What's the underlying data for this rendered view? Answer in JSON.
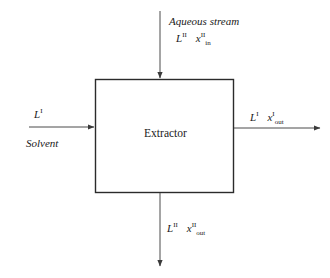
{
  "diagram": {
    "unit": {
      "label": "Extractor",
      "box": {
        "x": 95,
        "y": 79,
        "width": 139,
        "height": 114
      },
      "border_color": "#2b2b2b"
    },
    "line_color": "#4a4a4a",
    "background": "#ffffff",
    "streams": [
      {
        "id": "aqueous-feed",
        "position": "top",
        "direction": "into-unit",
        "title": "Aqueous stream",
        "flow_symbol": "L",
        "flow_superscript": "II",
        "composition_symbol": "x",
        "composition_superscript": "II",
        "composition_subscript": "in"
      },
      {
        "id": "solvent-feed",
        "position": "left",
        "direction": "into-unit",
        "title": "Solvent",
        "flow_symbol": "L",
        "flow_superscript": "I",
        "composition_symbol": "",
        "composition_superscript": "",
        "composition_subscript": ""
      },
      {
        "id": "extract-outlet",
        "position": "right",
        "direction": "out-of-unit",
        "title": "",
        "flow_symbol": "L",
        "flow_superscript": "I",
        "composition_symbol": "x",
        "composition_superscript": "I",
        "composition_subscript": "out"
      },
      {
        "id": "raffinate-outlet",
        "position": "bottom",
        "direction": "out-of-unit",
        "title": "",
        "flow_symbol": "L",
        "flow_superscript": "II",
        "composition_symbol": "x",
        "composition_superscript": "II",
        "composition_subscript": "out"
      }
    ]
  }
}
